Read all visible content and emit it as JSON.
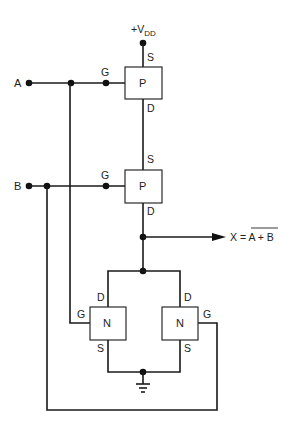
{
  "diagram": {
    "type": "CMOS NOR gate schematic",
    "supply": {
      "label": "+V",
      "subscript": "DD"
    },
    "inputs": [
      {
        "name": "A"
      },
      {
        "name": "B"
      }
    ],
    "output": {
      "lhs": "X = ",
      "expr": "A + B",
      "overlined": true
    },
    "transistors": [
      {
        "id": "p1",
        "type": "P",
        "gate": "G",
        "source": "S",
        "drain": "D",
        "connected_input": "A"
      },
      {
        "id": "p2",
        "type": "P",
        "gate": "G",
        "source": "S",
        "drain": "D",
        "connected_input": "B"
      },
      {
        "id": "n1",
        "type": "N",
        "gate": "G",
        "source": "S",
        "drain": "D",
        "connected_input": "A"
      },
      {
        "id": "n2",
        "type": "N",
        "gate": "G",
        "source": "S",
        "drain": "D",
        "connected_input": "B"
      }
    ],
    "ground": "ground-symbol"
  }
}
